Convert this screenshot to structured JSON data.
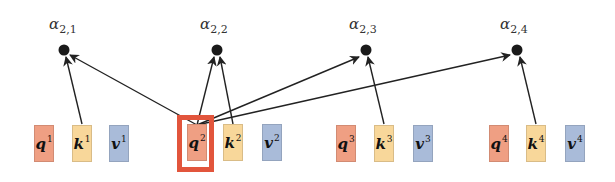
{
  "diagram": {
    "type": "self-attention-score-computation",
    "query_index": 2,
    "colors": {
      "query": "#ef9f83",
      "key": "#f8d79a",
      "value": "#a9bbd9",
      "highlight": "#e2553c",
      "arrow": "#222222",
      "node": "#1a1a1a"
    },
    "scores": [
      {
        "symbol": "α",
        "subscript": "2,1"
      },
      {
        "symbol": "α",
        "subscript": "2,2"
      },
      {
        "symbol": "α",
        "subscript": "2,3"
      },
      {
        "symbol": "α",
        "subscript": "2,4"
      }
    ],
    "tokens": [
      {
        "q": "q",
        "q_sup": "1",
        "k": "k",
        "k_sup": "1",
        "v": "v",
        "v_sup": "1"
      },
      {
        "q": "q",
        "q_sup": "2",
        "k": "k",
        "k_sup": "2",
        "v": "v",
        "v_sup": "2"
      },
      {
        "q": "q",
        "q_sup": "3",
        "k": "k",
        "k_sup": "3",
        "v": "v",
        "v_sup": "3"
      },
      {
        "q": "q",
        "q_sup": "4",
        "k": "k",
        "k_sup": "4",
        "v": "v",
        "v_sup": "4"
      }
    ],
    "edges": [
      {
        "from": "q2",
        "to": "alpha_2_1"
      },
      {
        "from": "k1",
        "to": "alpha_2_1"
      },
      {
        "from": "q2",
        "to": "alpha_2_2"
      },
      {
        "from": "k2",
        "to": "alpha_2_2"
      },
      {
        "from": "q2",
        "to": "alpha_2_3"
      },
      {
        "from": "k3",
        "to": "alpha_2_3"
      },
      {
        "from": "q2",
        "to": "alpha_2_4"
      },
      {
        "from": "k4",
        "to": "alpha_2_4"
      }
    ]
  }
}
